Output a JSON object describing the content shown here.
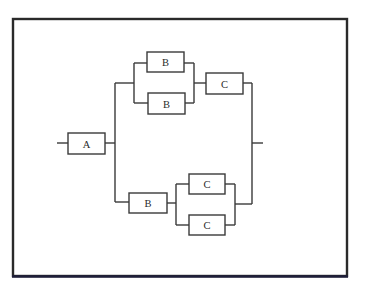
{
  "diagram": {
    "type": "reliability-block-diagram",
    "blocks": [
      {
        "id": "A",
        "label": "A"
      },
      {
        "id": "B1",
        "label": "B"
      },
      {
        "id": "B2",
        "label": "B"
      },
      {
        "id": "C1",
        "label": "C"
      },
      {
        "id": "B3",
        "label": "B"
      },
      {
        "id": "C2",
        "label": "C"
      },
      {
        "id": "C3",
        "label": "C"
      }
    ],
    "structure": "A in series with parallel( series(parallel(B,B), C), series(B, parallel(C,C)) )"
  }
}
